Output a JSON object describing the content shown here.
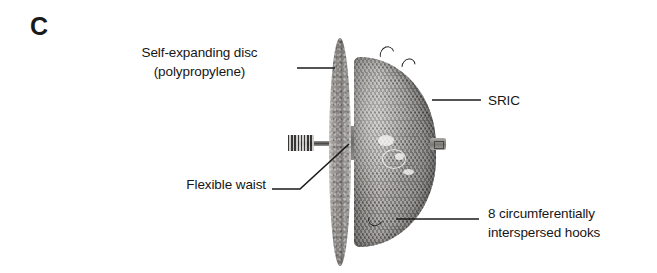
{
  "figure": {
    "panel_letter": "C",
    "background_color": "#ffffff",
    "text_color": "#161616"
  },
  "labels": {
    "disc": "Self-expanding disc\n(polypropylene)",
    "sric": "SRIC",
    "waist": "Flexible waist",
    "hooks": "8 circumferentially\ninterspersed hooks"
  },
  "device": {
    "disc_name": "self-expanding-polypropylene-disc",
    "dome_name": "sric-mesh-dome",
    "waist_name": "flexible-waist",
    "hook_count": 8
  }
}
